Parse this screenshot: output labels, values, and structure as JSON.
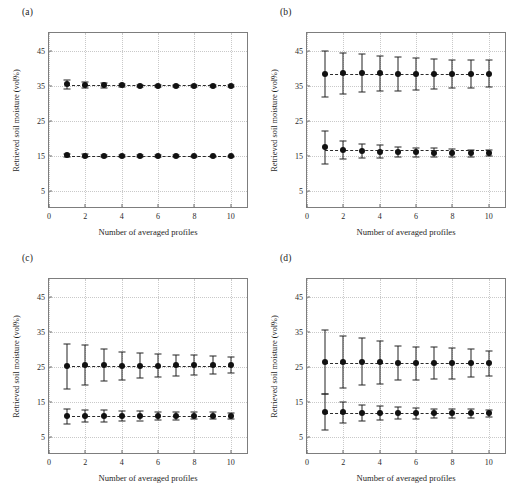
{
  "figure": {
    "ylabel": "Retrieved soil moisture (vol%)",
    "xlabel": "Number of averaged profiles",
    "yticks": [
      5,
      15,
      25,
      35,
      45
    ],
    "xticks": [
      0,
      2,
      4,
      6,
      8,
      10
    ],
    "marker_color": "#111111",
    "line_color": "#2b2b2b",
    "grid_color": "#c9c9c9",
    "frame_color": "#7d7d7d"
  },
  "chart_data": [
    {
      "type": "scatter",
      "panel": "(a)",
      "title": "",
      "xlabel": "Number of averaged profiles",
      "ylabel": "Retrieved soil moisture (vol%)",
      "xlim": [
        0,
        11
      ],
      "ylim": [
        0,
        50
      ],
      "xticks": [
        0,
        2,
        4,
        6,
        8,
        10
      ],
      "yticks": [
        5,
        15,
        25,
        35,
        45
      ],
      "grid": true,
      "legend": "none",
      "x": [
        1,
        2,
        3,
        4,
        5,
        6,
        7,
        8,
        9,
        10
      ],
      "series": [
        {
          "name": "upper",
          "values": [
            35.4,
            35.2,
            35.1,
            35.1,
            35.0,
            35.0,
            35.0,
            35.0,
            35.0,
            35.0
          ],
          "errors": [
            1.3,
            0.9,
            0.6,
            0.4,
            0.35,
            0.3,
            0.3,
            0.25,
            0.25,
            0.2
          ]
        },
        {
          "name": "lower",
          "values": [
            15.2,
            15.1,
            15.1,
            15.1,
            15.0,
            15.0,
            15.0,
            15.0,
            15.0,
            15.0
          ],
          "errors": [
            0.5,
            0.4,
            0.3,
            0.25,
            0.2,
            0.2,
            0.2,
            0.15,
            0.15,
            0.15
          ]
        }
      ]
    },
    {
      "type": "scatter",
      "panel": "(b)",
      "title": "",
      "xlabel": "Number of averaged profiles",
      "ylabel": "Retrieved soil moisture (vol%)",
      "xlim": [
        0,
        11
      ],
      "ylim": [
        0,
        50
      ],
      "xticks": [
        0,
        2,
        4,
        6,
        8,
        10
      ],
      "yticks": [
        5,
        15,
        25,
        35,
        45
      ],
      "grid": true,
      "legend": "none",
      "x": [
        1,
        2,
        3,
        4,
        5,
        6,
        7,
        8,
        9,
        10
      ],
      "series": [
        {
          "name": "upper",
          "values": [
            38.4,
            38.5,
            38.5,
            38.5,
            38.4,
            38.4,
            38.4,
            38.3,
            38.4,
            38.4
          ],
          "errors": [
            6.6,
            5.9,
            5.4,
            5.1,
            4.8,
            4.5,
            4.3,
            4.0,
            3.9,
            3.8
          ]
        },
        {
          "name": "lower",
          "values": [
            17.6,
            16.8,
            16.5,
            16.3,
            16.2,
            16.1,
            16.0,
            16.0,
            15.9,
            15.9
          ],
          "errors": [
            4.7,
            2.6,
            2.1,
            1.8,
            1.5,
            1.3,
            1.2,
            1.1,
            1.0,
            0.9
          ]
        }
      ]
    },
    {
      "type": "scatter",
      "panel": "(c)",
      "title": "",
      "xlabel": "Number of averaged profiles",
      "ylabel": "Retrieved soil moisture (vol%)",
      "xlim": [
        0,
        11
      ],
      "ylim": [
        0,
        50
      ],
      "xticks": [
        0,
        2,
        4,
        6,
        8,
        10
      ],
      "yticks": [
        5,
        15,
        25,
        35,
        45
      ],
      "grid": true,
      "legend": "none",
      "x": [
        1,
        2,
        3,
        4,
        5,
        6,
        7,
        8,
        9,
        10
      ],
      "series": [
        {
          "name": "upper",
          "values": [
            25.2,
            25.6,
            25.5,
            25.4,
            25.4,
            25.4,
            25.5,
            25.5,
            25.6,
            25.5
          ],
          "errors": [
            6.4,
            5.6,
            4.5,
            4.0,
            3.6,
            3.2,
            3.0,
            2.8,
            2.5,
            2.3
          ]
        },
        {
          "name": "lower",
          "values": [
            11.0,
            11.1,
            11.1,
            11.1,
            11.1,
            11.1,
            11.1,
            11.1,
            11.1,
            11.1
          ],
          "errors": [
            2.2,
            1.8,
            1.6,
            1.5,
            1.3,
            1.2,
            1.1,
            1.0,
            1.0,
            0.9
          ]
        }
      ]
    },
    {
      "type": "scatter",
      "panel": "(d)",
      "title": "",
      "xlabel": "Number of averaged profiles",
      "ylabel": "Retrieved soil moisture (vol%)",
      "xlim": [
        0,
        11
      ],
      "ylim": [
        0,
        50
      ],
      "xticks": [
        0,
        2,
        4,
        6,
        8,
        10
      ],
      "yticks": [
        5,
        15,
        25,
        35,
        45
      ],
      "grid": true,
      "legend": "none",
      "x": [
        1,
        2,
        3,
        4,
        5,
        6,
        7,
        8,
        9,
        10
      ],
      "series": [
        {
          "name": "upper",
          "values": [
            26.3,
            26.4,
            26.5,
            26.3,
            26.1,
            26.0,
            26.1,
            26.0,
            26.1,
            26.0
          ],
          "errors": [
            9.1,
            7.4,
            6.7,
            6.2,
            4.9,
            4.6,
            4.5,
            4.3,
            4.0,
            3.6
          ]
        },
        {
          "name": "lower",
          "values": [
            12.2,
            12.1,
            12.0,
            11.9,
            11.8,
            11.8,
            11.8,
            11.8,
            11.8,
            11.8
          ],
          "errors": [
            5.2,
            2.9,
            2.2,
            1.9,
            1.7,
            1.5,
            1.4,
            1.3,
            1.2,
            1.1
          ]
        }
      ]
    }
  ]
}
